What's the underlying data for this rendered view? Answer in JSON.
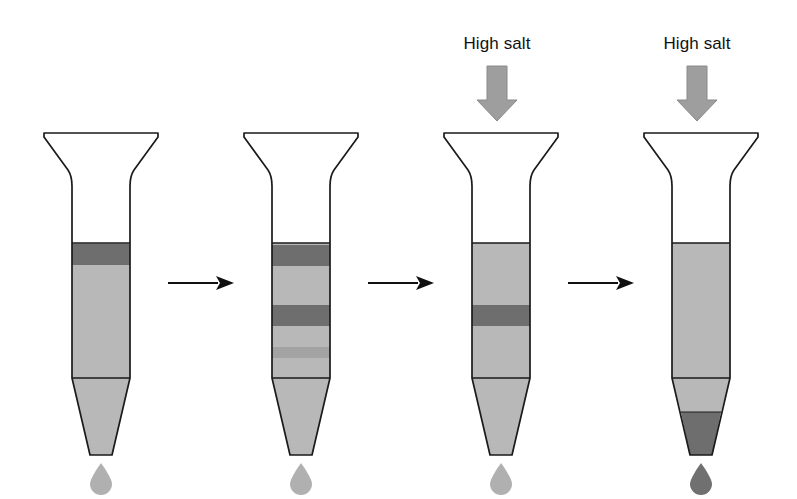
{
  "figure": {
    "background_color": "#ffffff",
    "outline_color": "#1a1a1a",
    "resin_color": "#b8b8b8",
    "band_color": "#6e6e6e",
    "band_color_light": "#a3a3a3",
    "arrow_color": "#111111",
    "salt_arrow_color": "#9e9e9e",
    "droplet_light_color": "#b0b0b0",
    "droplet_dark_color": "#707070"
  },
  "labels": {
    "high_salt_3": "High salt",
    "high_salt_4": "High salt"
  },
  "columns": [
    {
      "id": "column-1",
      "stage": 1,
      "caption": "",
      "resin_top": 243,
      "resin_bottom": 378,
      "bands": [
        {
          "name": "sample-band",
          "top": 244,
          "bottom": 265,
          "shade": "dark"
        }
      ],
      "cone_fill": "resin",
      "droplet": "light",
      "salt_applied": false
    },
    {
      "id": "column-2",
      "stage": 2,
      "caption": "",
      "resin_top": 243,
      "resin_bottom": 378,
      "bands": [
        {
          "name": "band-upper",
          "top": 245,
          "bottom": 266,
          "shade": "dark"
        },
        {
          "name": "band-lower",
          "top": 305,
          "bottom": 326,
          "shade": "dark"
        },
        {
          "name": "band-faint",
          "top": 347,
          "bottom": 358,
          "shade": "faint"
        }
      ],
      "cone_fill": "resin",
      "droplet": "light",
      "salt_applied": false
    },
    {
      "id": "column-3",
      "stage": 3,
      "caption": "High salt",
      "resin_top": 243,
      "resin_bottom": 378,
      "bands": [
        {
          "name": "retained-band",
          "top": 305,
          "bottom": 326,
          "shade": "dark"
        }
      ],
      "cone_fill": "resin",
      "droplet": "light",
      "salt_applied": true
    },
    {
      "id": "column-4",
      "stage": 4,
      "caption": "High salt",
      "resin_top": 243,
      "resin_bottom": 378,
      "bands": [],
      "cone_fill": "resin-with-dark-tip",
      "cone_dark_top": 412,
      "droplet": "dark",
      "salt_applied": true
    }
  ],
  "transition_arrows": [
    {
      "name": "arrow-1-to-2",
      "from": "column-1",
      "to": "column-2",
      "x_start": 168,
      "x_end": 228,
      "y": 283
    },
    {
      "name": "arrow-2-to-3",
      "from": "column-2",
      "to": "column-3",
      "x_start": 368,
      "x_end": 428,
      "y": 283
    },
    {
      "name": "arrow-3-to-4",
      "from": "column-3",
      "to": "column-4",
      "x_start": 568,
      "x_end": 628,
      "y": 283
    }
  ],
  "salt_arrows": [
    {
      "name": "salt-arrow-3",
      "x": 497,
      "y_top": 66,
      "y_bottom": 118
    },
    {
      "name": "salt-arrow-4",
      "x": 697,
      "y_top": 66,
      "y_bottom": 118
    }
  ]
}
